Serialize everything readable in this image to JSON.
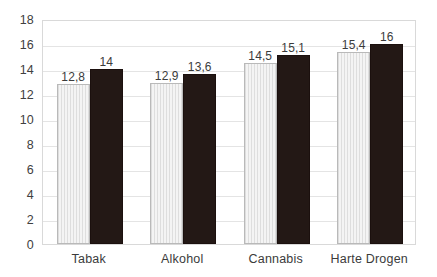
{
  "chart_data": {
    "type": "bar",
    "title": "",
    "subtitle": "",
    "xlabel": "",
    "ylabel": "",
    "categories": [
      "Tabak",
      "Alkohol",
      "Cannabis",
      "Harte Drogen"
    ],
    "series": [
      {
        "name": "series-1",
        "style": "light-hatched",
        "color": "#f4f4f4",
        "values": [
          12.8,
          12.9,
          14.5,
          15.4
        ],
        "value_labels": [
          "12,8",
          "12,9",
          "14,5",
          "15,4"
        ]
      },
      {
        "name": "series-2",
        "style": "solid-dark",
        "color": "#231815",
        "values": [
          14,
          13.6,
          15.1,
          16
        ],
        "value_labels": [
          "14",
          "13,6",
          "15,1",
          "16"
        ]
      }
    ],
    "ylim": [
      0,
      18
    ],
    "ytick_step": 2,
    "ytick_labels": [
      "0",
      "2",
      "4",
      "6",
      "8",
      "10",
      "12",
      "14",
      "16",
      "18"
    ],
    "grid": "horizontal",
    "legend": "none",
    "gridline_color": "#e4e4e4",
    "plot_border_color": "#d9d9d9",
    "background_color": "#ffffff",
    "text_color": "#3b3b3b"
  }
}
